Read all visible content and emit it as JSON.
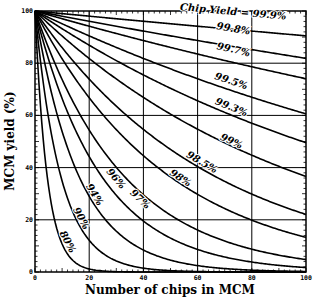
{
  "chart_data": {
    "type": "line",
    "title": "",
    "xlabel": "Number of chips in MCM",
    "ylabel": "MCM yield (%)",
    "xlim": [
      0,
      100
    ],
    "ylim": [
      0,
      100
    ],
    "x_ticks": [
      0,
      20,
      40,
      60,
      80,
      100
    ],
    "y_ticks": [
      0,
      20,
      40,
      60,
      80,
      100
    ],
    "grid": true,
    "formula": "MCM yield = 100 * (chip_yield)^N",
    "legend_header": "Chip Yield =",
    "series": [
      {
        "name": "99.9%",
        "chip_yield": 0.999,
        "label": "Chip Yield = 99.9%",
        "label_pos": [
          73,
          98.5
        ],
        "values_at_x": {
          "0": 100,
          "20": 98.0,
          "40": 96.1,
          "60": 94.2,
          "80": 92.3,
          "100": 90.5
        }
      },
      {
        "name": "99.8%",
        "chip_yield": 0.998,
        "label": "99.8%",
        "label_pos": [
          73,
          92
        ],
        "values_at_x": {
          "0": 100,
          "20": 96.1,
          "40": 92.3,
          "60": 88.7,
          "80": 85.2,
          "100": 81.9
        }
      },
      {
        "name": "99.7%",
        "chip_yield": 0.997,
        "label": "99.7%",
        "label_pos": [
          73,
          84
        ],
        "values_at_x": {
          "0": 100,
          "20": 94.2,
          "40": 88.7,
          "60": 83.5,
          "80": 78.7,
          "100": 74.0
        }
      },
      {
        "name": "99.5%",
        "chip_yield": 0.995,
        "label": "99.5%",
        "label_pos": [
          72,
          72
        ],
        "values_at_x": {
          "0": 100,
          "20": 90.5,
          "40": 81.8,
          "60": 74.0,
          "80": 67.0,
          "100": 60.6
        }
      },
      {
        "name": "99.3%",
        "chip_yield": 0.993,
        "label": "99.3%",
        "label_pos": [
          72,
          62
        ],
        "values_at_x": {
          "0": 100,
          "20": 86.9,
          "40": 75.5,
          "60": 65.6,
          "80": 57.0,
          "100": 49.5
        }
      },
      {
        "name": "99%",
        "chip_yield": 0.99,
        "label": "99%",
        "label_pos": [
          72,
          49
        ],
        "values_at_x": {
          "0": 100,
          "20": 81.8,
          "40": 66.9,
          "60": 54.7,
          "80": 44.8,
          "100": 36.6
        }
      },
      {
        "name": "98.5%",
        "chip_yield": 0.985,
        "label": "98.5%",
        "label_pos": [
          61,
          41
        ],
        "values_at_x": {
          "0": 100,
          "20": 73.9,
          "40": 54.7,
          "60": 40.4,
          "80": 29.9,
          "100": 22.1
        }
      },
      {
        "name": "98%",
        "chip_yield": 0.98,
        "label": "98%",
        "label_pos": [
          53,
          35
        ],
        "values_at_x": {
          "0": 100,
          "20": 66.8,
          "40": 44.6,
          "60": 29.8,
          "80": 19.9,
          "100": 13.3
        }
      },
      {
        "name": "97%",
        "chip_yield": 0.97,
        "label": "97%",
        "label_pos": [
          38,
          27
        ],
        "values_at_x": {
          "0": 100,
          "20": 54.4,
          "40": 29.6,
          "60": 16.1,
          "80": 8.7,
          "100": 4.8
        }
      },
      {
        "name": "96%",
        "chip_yield": 0.96,
        "label": "96%",
        "label_pos": [
          29,
          35
        ],
        "values_at_x": {
          "0": 100,
          "20": 44.2,
          "40": 19.5,
          "60": 8.6,
          "80": 3.8,
          "100": 1.7
        }
      },
      {
        "name": "94%",
        "chip_yield": 0.94,
        "label": "94%",
        "label_pos": [
          21,
          29
        ],
        "values_at_x": {
          "0": 100,
          "20": 29.0,
          "40": 8.4,
          "60": 2.4,
          "80": 0.7,
          "100": 0.2
        }
      },
      {
        "name": "90%",
        "chip_yield": 0.9,
        "label": "90%",
        "label_pos": [
          16,
          20
        ],
        "values_at_x": {
          "0": 100,
          "20": 12.2,
          "40": 1.5,
          "60": 0.2,
          "80": 0.0,
          "100": 0.0
        }
      },
      {
        "name": "80%",
        "chip_yield": 0.8,
        "label": "80%",
        "label_pos": [
          11,
          11
        ],
        "values_at_x": {
          "0": 100,
          "20": 1.2,
          "40": 0.0,
          "60": 0.0,
          "80": 0.0,
          "100": 0.0
        }
      }
    ]
  }
}
